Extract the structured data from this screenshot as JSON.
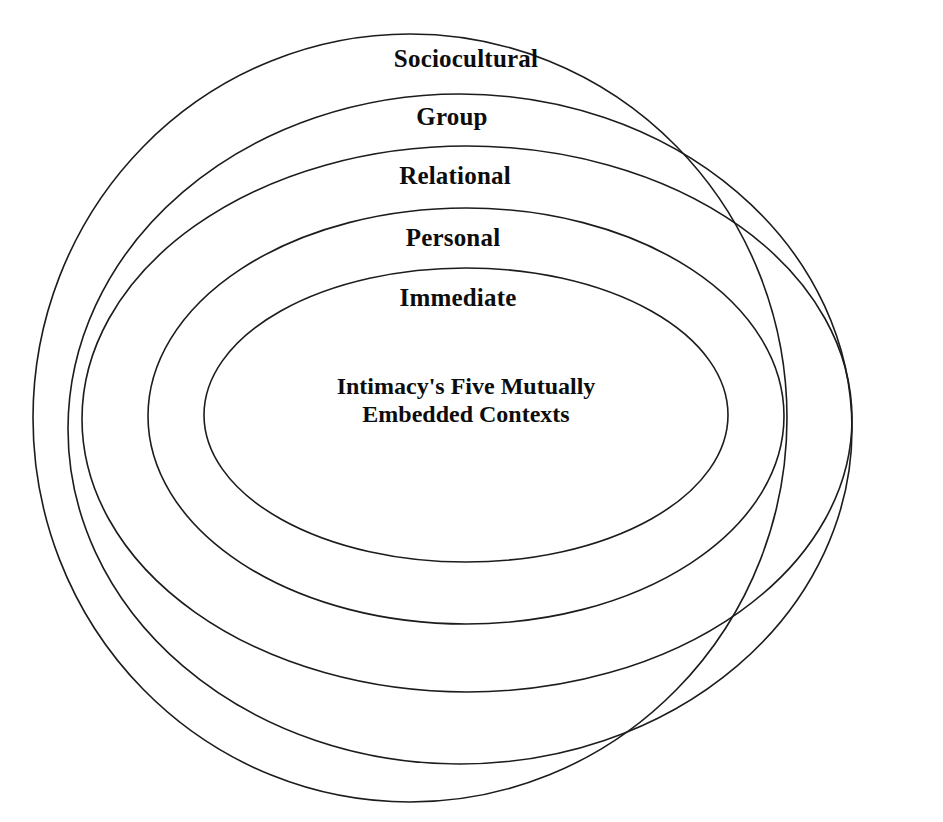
{
  "diagram": {
    "title": "Intimacy's Five Mutually Embedded Contexts",
    "type": "concentric-ellipses",
    "background_color": "#ffffff",
    "stroke_color": "#1c1c1c",
    "text_color": "#0d0d0d",
    "center_label": {
      "line1": "Intimacy's Five Mutually",
      "line2": "Embedded Contexts",
      "x": 466,
      "y": 372
    },
    "rings": [
      {
        "label": "Sociocultural",
        "level": 5,
        "order_outermost_to_innermost": 1,
        "cx": 410,
        "cy": 418,
        "rx": 377,
        "ry": 384,
        "label_x": 466,
        "label_y": 46
      },
      {
        "label": "Group",
        "level": 4,
        "order_outermost_to_innermost": 2,
        "cx": 460,
        "cy": 429,
        "rx": 392,
        "ry": 335,
        "label_x": 452,
        "label_y": 104
      },
      {
        "label": "Relational",
        "level": 3,
        "order_outermost_to_innermost": 3,
        "cx": 467,
        "cy": 419,
        "rx": 385,
        "ry": 273,
        "label_x": 455,
        "label_y": 163
      },
      {
        "label": "Personal",
        "level": 2,
        "order_outermost_to_innermost": 4,
        "cx": 466,
        "cy": 416,
        "rx": 318,
        "ry": 208,
        "label_x": 453,
        "label_y": 225
      },
      {
        "label": "Immediate",
        "level": 1,
        "order_outermost_to_innermost": 5,
        "cx": 466,
        "cy": 415,
        "rx": 262,
        "ry": 147,
        "label_x": 458,
        "label_y": 285
      }
    ]
  }
}
